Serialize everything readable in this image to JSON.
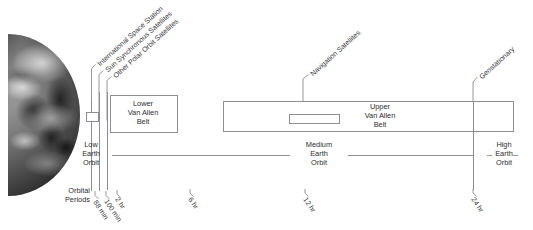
{
  "diagram": {
    "line_color": "#8d8d93",
    "text_color": "#2d2d2d"
  },
  "callouts": {
    "iss": "International Space Station",
    "sun_sync": "Sun Synchronous Satellites",
    "other_polar": "Other Polar Orbit Satellites",
    "navigation": "Navigation Satellites",
    "geostationary": "Geostationary"
  },
  "belts": {
    "lower": {
      "line1": "Lower",
      "line2": "Van Allen",
      "line3": "Belt"
    },
    "upper": {
      "line1": "Upper",
      "line2": "Van Allen",
      "line3": "Belt"
    }
  },
  "regions": {
    "leo": {
      "line1": "Low",
      "line2": "Earth",
      "line3": "Orbit"
    },
    "meo": {
      "line1": "Medium",
      "line2": "Earth",
      "line3": "Orbit"
    },
    "heo": {
      "line1": "High",
      "line2": "Earth",
      "line3": "Orbit"
    }
  },
  "axis": {
    "label_line1": "Orbital",
    "label_line2": "Periods",
    "ticks": [
      {
        "value": "88 min"
      },
      {
        "value": "100 min"
      },
      {
        "value": "2 hr"
      },
      {
        "value": "6 hr"
      },
      {
        "value": "12 hr"
      },
      {
        "value": "24 hr"
      }
    ]
  }
}
